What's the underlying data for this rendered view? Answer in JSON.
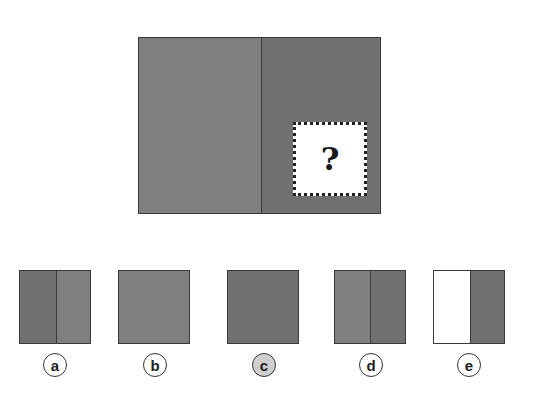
{
  "puzzle": {
    "main_figure": {
      "left_color": "#7f7f7f",
      "right_color": "#707070",
      "missing_piece_symbol": "?"
    },
    "options": [
      {
        "label": "a",
        "segments": [
          "#707070",
          "#7f7f7f"
        ],
        "selected": false
      },
      {
        "label": "b",
        "segments": [
          "#7f7f7f"
        ],
        "selected": false
      },
      {
        "label": "c",
        "segments": [
          "#707070"
        ],
        "selected": true
      },
      {
        "label": "d",
        "segments": [
          "#7f7f7f",
          "#707070"
        ],
        "selected": false
      },
      {
        "label": "e",
        "segments": [
          "#ffffff",
          "#707070"
        ],
        "selected": false
      }
    ]
  }
}
